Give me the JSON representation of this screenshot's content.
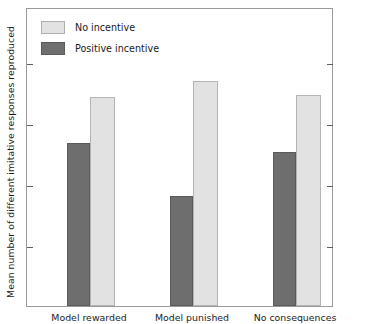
{
  "chart_data": {
    "type": "bar",
    "title": "",
    "xlabel": "",
    "ylabel": "Mean number of different imitative responses reproduced",
    "categories": [
      "Model rewarded",
      "Model punished",
      "No consequences"
    ],
    "series": [
      {
        "name": "No incentive",
        "color": "#e2e2e2",
        "values": [
          3.43,
          3.68,
          3.45
        ]
      },
      {
        "name": "Positive incentive",
        "color": "#6e6e6e",
        "values": [
          2.67,
          1.8,
          2.52
        ]
      }
    ],
    "yticks": [
      1,
      2,
      3,
      4
    ],
    "ytick_labels": [
      "1",
      "2",
      "3",
      "4"
    ],
    "ylim": [
      0,
      4.9
    ],
    "grid": false,
    "legend_position": "top-left",
    "frame": true
  },
  "legend": {
    "items": [
      {
        "label": "No incentive"
      },
      {
        "label": "Positive incentive"
      }
    ]
  },
  "axes": {
    "y_title": "Mean number of different imitative responses reproduced"
  }
}
